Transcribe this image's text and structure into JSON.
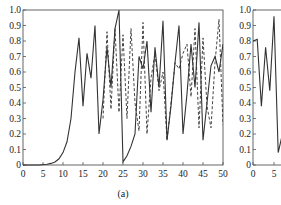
{
  "chart_data": [
    {
      "type": "line",
      "panel_label": "(a)",
      "title": "",
      "xlabel": "",
      "ylabel": "",
      "xlim": [
        0,
        50
      ],
      "ylim": [
        0,
        1.0
      ],
      "grid": false,
      "legend": null,
      "x_ticks": [
        "0",
        "5",
        "10",
        "15",
        "20",
        "25",
        "30",
        "35",
        "40",
        "45",
        "50"
      ],
      "y_ticks": [
        "0",
        "0.1",
        "0.2",
        "0.3",
        "0.4",
        "0.5",
        "0.6",
        "0.7",
        "0.8",
        "0.9",
        "1.0"
      ],
      "series": [
        {
          "name": "solid",
          "style": "solid",
          "x": [
            0,
            2,
            4,
            6,
            7,
            8,
            9,
            10,
            11,
            12,
            12.5,
            13,
            14,
            15,
            16,
            17,
            18,
            19,
            20,
            21,
            22,
            23,
            24,
            25,
            26,
            27,
            28,
            29,
            30,
            31,
            32,
            33,
            34,
            35,
            36,
            37,
            38,
            39,
            40,
            41,
            42,
            43,
            44,
            45,
            46,
            47,
            48,
            49,
            50
          ],
          "y": [
            0.0,
            0.0,
            0.0,
            0.005,
            0.01,
            0.02,
            0.04,
            0.08,
            0.15,
            0.3,
            0.45,
            0.6,
            0.82,
            0.38,
            0.72,
            0.56,
            0.9,
            0.2,
            0.42,
            0.76,
            0.5,
            0.88,
            1.0,
            0.02,
            0.06,
            0.12,
            0.2,
            0.7,
            0.62,
            0.8,
            0.34,
            0.76,
            0.5,
            0.93,
            0.16,
            0.38,
            0.66,
            0.9,
            0.2,
            0.46,
            0.78,
            0.5,
            0.92,
            0.16,
            0.4,
            0.64,
            0.7,
            0.6,
            0.78
          ]
        },
        {
          "name": "dashed",
          "style": "dashed",
          "x": [
            20,
            21,
            22,
            23,
            24,
            25,
            26,
            27,
            28,
            29,
            30,
            31,
            32,
            33,
            34,
            35,
            36,
            37,
            38,
            39,
            40,
            41,
            42,
            43,
            44,
            45,
            46,
            47,
            48,
            49,
            50
          ],
          "y": [
            0.3,
            0.86,
            0.36,
            0.88,
            0.34,
            0.84,
            0.3,
            0.88,
            0.4,
            0.22,
            0.92,
            0.2,
            0.56,
            0.72,
            0.48,
            0.6,
            0.16,
            0.4,
            0.66,
            0.62,
            0.72,
            0.78,
            0.44,
            0.88,
            0.24,
            0.82,
            0.38,
            0.24,
            0.66,
            0.94,
            0.26
          ]
        }
      ]
    },
    {
      "type": "line",
      "panel_label": "",
      "title": "",
      "xlim": [
        0,
        6
      ],
      "ylim": [
        0,
        1.0
      ],
      "grid": false,
      "x_ticks": [
        "0",
        "5"
      ],
      "y_ticks": [
        "0",
        "0.1",
        "0.2",
        "0.3",
        "0.4",
        "0.5",
        "0.6",
        "0.7",
        "0.8",
        "0.9",
        "1.0"
      ],
      "series": [
        {
          "name": "solid",
          "style": "solid",
          "x": [
            0,
            1,
            2,
            3,
            4,
            5,
            6,
            7
          ],
          "y": [
            0.8,
            0.81,
            0.38,
            0.76,
            0.48,
            0.96,
            0.08,
            0.2
          ]
        }
      ]
    }
  ],
  "panel_a": {
    "caption": "(a)",
    "x_ticks": [
      "0",
      "5",
      "10",
      "15",
      "20",
      "25",
      "30",
      "35",
      "40",
      "45",
      "50"
    ],
    "y_ticks": [
      "0",
      "0.1",
      "0.2",
      "0.3",
      "0.4",
      "0.5",
      "0.6",
      "0.7",
      "0.8",
      "0.9",
      "1.0"
    ]
  },
  "panel_b": {
    "x_ticks": [
      "0",
      "5"
    ],
    "y_ticks": [
      "0",
      "0.1",
      "0.2",
      "0.3",
      "0.4",
      "0.5",
      "0.6",
      "0.7",
      "0.8",
      "0.9",
      "1.0"
    ]
  }
}
